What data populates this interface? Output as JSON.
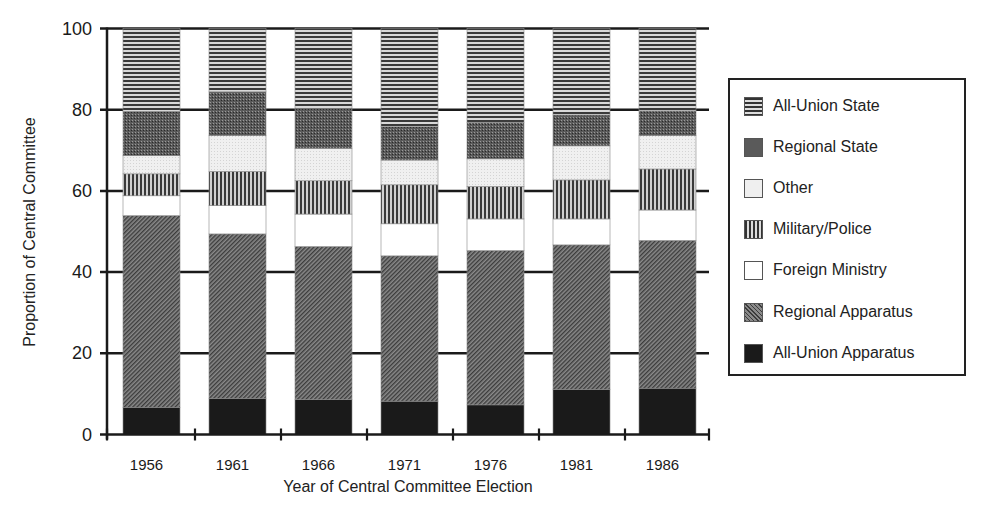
{
  "chart_data": {
    "type": "bar",
    "stacked": true,
    "title": "",
    "xlabel": "Year of Central Committee Election",
    "ylabel": "Proportion of Central Committee",
    "ylim": [
      0,
      100
    ],
    "yticks": [
      0,
      20,
      40,
      60,
      80,
      100
    ],
    "grid": "horizontal at y ticks",
    "legend_position": "right",
    "categories": [
      "1956",
      "1961",
      "1966",
      "1971",
      "1976",
      "1981",
      "1986"
    ],
    "series": [
      {
        "name": "All-Union Apparatus",
        "pattern": "solid-black",
        "values": [
          6.7,
          8.9,
          8.6,
          8.2,
          7.3,
          11.1,
          11.4
        ]
      },
      {
        "name": "Regional Apparatus",
        "pattern": "diagonal-hatch",
        "values": [
          47.2,
          40.5,
          37.7,
          35.8,
          38.0,
          35.6,
          36.4
        ]
      },
      {
        "name": "Foreign Ministry",
        "pattern": "white",
        "values": [
          4.9,
          7.0,
          8.0,
          7.9,
          7.8,
          6.4,
          7.5
        ]
      },
      {
        "name": "Military/Police",
        "pattern": "vertical-lines",
        "values": [
          5.4,
          8.4,
          8.2,
          9.6,
          8.0,
          9.6,
          10.1
        ]
      },
      {
        "name": "Other",
        "pattern": "light-stipple",
        "values": [
          4.5,
          8.8,
          8.0,
          6.1,
          6.8,
          8.4,
          8.2
        ]
      },
      {
        "name": "Regional State",
        "pattern": "dark-stipple",
        "values": [
          10.9,
          10.8,
          9.8,
          8.2,
          9.0,
          7.6,
          6.1
        ]
      },
      {
        "name": "All-Union State",
        "pattern": "horizontal-lines",
        "values": [
          20.4,
          15.6,
          19.7,
          24.2,
          23.1,
          21.3,
          20.3
        ]
      }
    ]
  },
  "legend": {
    "items": [
      {
        "label": "All-Union State",
        "pattern": "horizontal-lines"
      },
      {
        "label": "Regional State",
        "pattern": "dark-stipple"
      },
      {
        "label": "Other",
        "pattern": "light-stipple"
      },
      {
        "label": "Military/Police",
        "pattern": "vertical-lines"
      },
      {
        "label": "Foreign Ministry",
        "pattern": "white"
      },
      {
        "label": "Regional Apparatus",
        "pattern": "diagonal-hatch"
      },
      {
        "label": "All-Union Apparatus",
        "pattern": "solid-black"
      }
    ]
  },
  "axes": {
    "xlabel": "Year of Central Committee Election",
    "ylabel": "Proportion of Central Committee"
  }
}
